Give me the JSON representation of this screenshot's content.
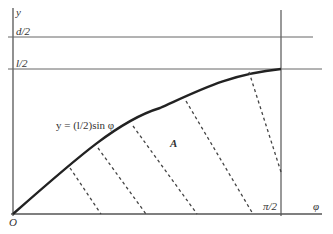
{
  "diagram": {
    "labels": {
      "y_axis": "y",
      "x_axis": "φ",
      "origin": "O",
      "d_half": "d/2",
      "l_half": "l/2",
      "pi_half": "π/2",
      "curve_equation": "y = (l/2)sin φ",
      "area": "A"
    },
    "colors": {
      "axis": "#555555",
      "curve": "#222222",
      "dashed": "#444444",
      "guide": "#666666",
      "background": "#ffffff"
    },
    "geometry": {
      "origin_px": [
        13,
        214
      ],
      "x_axis_end_px": 322,
      "y_axis_top_px": 10,
      "pi_half_x_px": 281,
      "d_half_y_px": 37,
      "l_half_y_px": 69,
      "dashed_lines": [
        {
          "from": [
            70,
            168
          ],
          "to": [
            101,
            214
          ]
        },
        {
          "from": [
            98,
            148
          ],
          "to": [
            146,
            214
          ]
        },
        {
          "from": [
            133,
            126
          ],
          "to": [
            197,
            214
          ]
        },
        {
          "from": [
            186,
            101
          ],
          "to": [
            253,
            214
          ]
        },
        {
          "from": [
            249,
            72
          ],
          "to": [
            281,
            172
          ]
        }
      ]
    }
  }
}
